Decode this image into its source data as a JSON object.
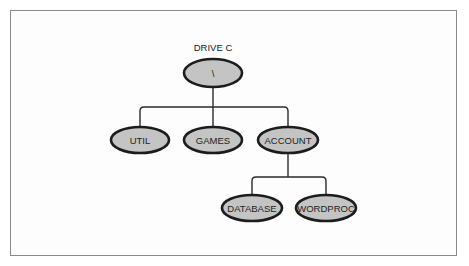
{
  "diagram": {
    "type": "directory-tree",
    "title": "DRIVE C",
    "colors": {
      "node_fill": "#c4c4c4",
      "node_stroke": "#1c1c1c",
      "connector": "#2a2a2a",
      "frame_border": "#8a8a8a",
      "background": "#ffffff"
    },
    "nodes": {
      "root": {
        "label": "\\"
      },
      "util": {
        "label": "UTIL",
        "parent": "root"
      },
      "games": {
        "label": "GAMES",
        "parent": "root"
      },
      "account": {
        "label": "ACCOUNT",
        "parent": "root"
      },
      "database": {
        "label": "DATABASE",
        "parent": "account"
      },
      "wordproc": {
        "label": "WORDPROC",
        "parent": "account"
      }
    },
    "edges": [
      {
        "from": "root",
        "to": "util"
      },
      {
        "from": "root",
        "to": "games"
      },
      {
        "from": "root",
        "to": "account"
      },
      {
        "from": "account",
        "to": "database"
      },
      {
        "from": "account",
        "to": "wordproc"
      }
    ]
  }
}
